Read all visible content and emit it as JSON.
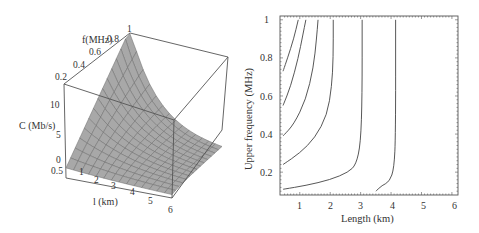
{
  "chart_data": [
    {
      "type": "surface3d",
      "title": "",
      "xlabel": "l (km)",
      "ylabel": "f (MHz)",
      "zlabel": "C (Mb/s)",
      "x_ticks": [
        "0.5",
        "1",
        "2",
        "3",
        "4",
        "5",
        "6"
      ],
      "y_ticks": [
        "0.2",
        "0.4",
        "0.6",
        "0.8",
        "1"
      ],
      "z_ticks": [
        "0",
        "5",
        "10"
      ],
      "xlim": [
        0.5,
        6
      ],
      "ylim": [
        0.1,
        1
      ],
      "zlim": [
        0,
        12
      ],
      "description": "Capacity surface rising steeply toward short length and high upper frequency; near flat low values at long lengths"
    },
    {
      "type": "contour",
      "title": "",
      "xlabel": "Length (km)",
      "ylabel": "Upper frequency (MHz)",
      "x_ticks": [
        "1",
        "2",
        "3",
        "4",
        "5",
        "6"
      ],
      "y_ticks": [
        "0.2",
        "0.4",
        "0.6",
        "0.8",
        "1"
      ],
      "xlim": [
        0.35,
        6.2
      ],
      "ylim": [
        0.08,
        1.02
      ],
      "grid": false,
      "contours": [
        {
          "points": [
            [
              0.45,
              0.73
            ],
            [
              0.6,
              0.8
            ],
            [
              0.8,
              0.9
            ],
            [
              0.95,
              1.0
            ]
          ]
        },
        {
          "points": [
            [
              0.45,
              0.55
            ],
            [
              0.7,
              0.65
            ],
            [
              0.95,
              0.8
            ],
            [
              1.1,
              0.92
            ],
            [
              1.2,
              1.0
            ]
          ]
        },
        {
          "points": [
            [
              0.45,
              0.39
            ],
            [
              0.8,
              0.45
            ],
            [
              1.2,
              0.58
            ],
            [
              1.45,
              0.75
            ],
            [
              1.55,
              0.9
            ],
            [
              1.6,
              1.0
            ]
          ]
        },
        {
          "points": [
            [
              0.45,
              0.24
            ],
            [
              1.0,
              0.3
            ],
            [
              1.5,
              0.38
            ],
            [
              1.9,
              0.5
            ],
            [
              2.05,
              0.65
            ],
            [
              2.1,
              0.8
            ],
            [
              2.1,
              1.0
            ]
          ]
        },
        {
          "points": [
            [
              0.45,
              0.11
            ],
            [
              1.2,
              0.13
            ],
            [
              2.0,
              0.16
            ],
            [
              2.6,
              0.2
            ],
            [
              2.85,
              0.24
            ],
            [
              3.0,
              0.35
            ],
            [
              3.05,
              0.6
            ],
            [
              3.05,
              1.0
            ]
          ]
        },
        {
          "points": [
            [
              3.5,
              0.1
            ],
            [
              3.7,
              0.13
            ],
            [
              3.95,
              0.15
            ],
            [
              4.1,
              0.22
            ],
            [
              4.15,
              0.4
            ],
            [
              4.15,
              1.0
            ]
          ]
        }
      ]
    }
  ],
  "left_plot": {
    "y_axis_label": "f(MHz)",
    "z_axis_label": "C (Mb/s)",
    "x_axis_label": "l (km)",
    "f_ticks": [
      "0.2",
      "0.4",
      "0.6",
      "0.8",
      "1"
    ],
    "c_ticks": [
      "10",
      "5",
      "0"
    ],
    "l_ticks": [
      "0.5",
      "1",
      "2",
      "3",
      "4",
      "5",
      "6"
    ]
  },
  "right_plot": {
    "x_axis_label": "Length (km)",
    "y_axis_label": "Upper frequency (MHz)",
    "x_ticks": [
      "1",
      "2",
      "3",
      "4",
      "5",
      "6"
    ],
    "y_ticks": [
      "1",
      "0.8",
      "0.6",
      "0.4",
      "0.2"
    ]
  },
  "colors": {
    "surface": "#a8a8a8",
    "line": "#444444",
    "mesh": "#6a6a6a"
  }
}
